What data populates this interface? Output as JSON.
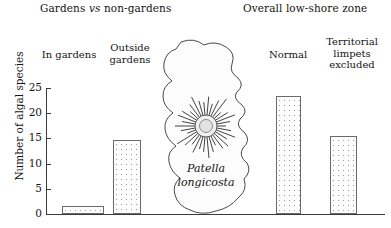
{
  "figure": {
    "group_titles": {
      "left_pre": "Gardens ",
      "left_em": "vs",
      "left_post": " non-gardens",
      "right": "Overall low-shore zone"
    },
    "species_label": "Patella\nlongicosta",
    "axis": {
      "y_title": "Number of algal species",
      "y_ticks": [
        "25",
        "20",
        "15",
        "10",
        "5",
        "0"
      ]
    }
  },
  "chart_data": {
    "type": "bar",
    "title": "",
    "xlabel": "",
    "ylabel": "Number of algal species",
    "ylim": [
      0,
      25
    ],
    "yticks": [
      0,
      5,
      10,
      15,
      20,
      25
    ],
    "grid": false,
    "legend": "none",
    "categories": [
      "In gardens",
      "Outside\ngardens",
      "Normal",
      "Territorial\nlimpets\nexcluded"
    ],
    "values": [
      1.6,
      14.7,
      23.4,
      15.4
    ],
    "groups": [
      {
        "name": "Gardens vs non-gardens",
        "categories": [
          "In gardens",
          "Outside gardens"
        ]
      },
      {
        "name": "Overall low-shore zone",
        "categories": [
          "Normal",
          "Territorial limpets excluded"
        ]
      }
    ],
    "annotations": [
      "Patella longicosta"
    ]
  }
}
